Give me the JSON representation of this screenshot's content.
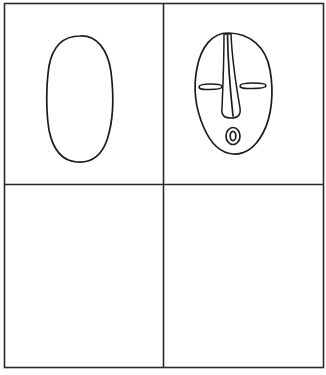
{
  "figure": {
    "type": "step-by-step drawing grid",
    "layout": {
      "rows": 2,
      "columns": 2
    },
    "colors": {
      "background": "#ffffff",
      "ink": "#1c1c1c",
      "grid": "#2a2a2a"
    },
    "panels": [
      {
        "position": "top-left",
        "step": 1,
        "content": "oval outline"
      },
      {
        "position": "top-right",
        "step": 2,
        "content": "mask face with long nose, slit eyes and round mouth"
      },
      {
        "position": "bottom-left",
        "step": 3,
        "content": "empty"
      },
      {
        "position": "bottom-right",
        "step": 4,
        "content": "empty"
      }
    ]
  }
}
